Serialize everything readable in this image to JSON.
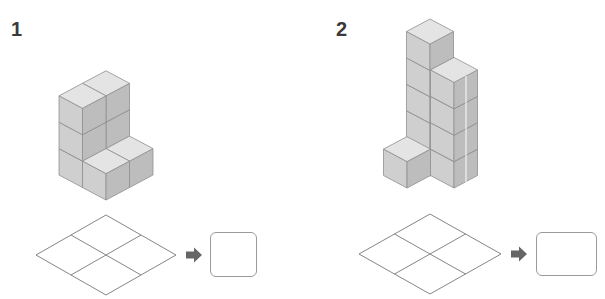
{
  "problems": [
    {
      "number": "1",
      "figure": "cube-stack-1",
      "columns": [
        {
          "position": "back",
          "height": 3
        },
        {
          "position": "left",
          "height": 3
        },
        {
          "position": "right",
          "height": 1
        },
        {
          "position": "front",
          "height": 1
        }
      ],
      "grid": {
        "rows": 2,
        "cols": 2
      },
      "arrow_icon": "arrow-right-icon",
      "answer": ""
    },
    {
      "number": "2",
      "figure": "cube-stack-2",
      "columns": [
        {
          "position": "back",
          "height": 5
        },
        {
          "position": "right",
          "height": 4
        },
        {
          "position": "left",
          "height": 1
        }
      ],
      "grid": {
        "rows": 2,
        "cols": 2
      },
      "arrow_icon": "arrow-right-icon",
      "answer": ""
    }
  ],
  "colors": {
    "top_face": "#e4e4e4",
    "left_face": "#cfcfcf",
    "right_face": "#bdbdbd",
    "edge": "#8f8f8f",
    "grid_line": "#777777",
    "arrow": "#666666",
    "label": "#3a3a3a"
  }
}
